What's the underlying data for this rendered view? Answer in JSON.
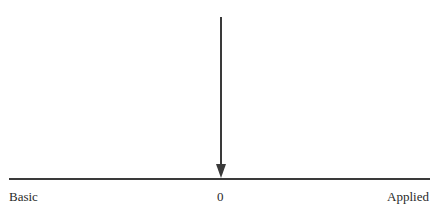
{
  "diagram": {
    "type": "continuum-axis",
    "axis": {
      "left_label": "Basic",
      "center_label": "0",
      "right_label": "Applied"
    },
    "marker": {
      "description": "downward arrow pointing at center (0)",
      "position": "0"
    },
    "colors": {
      "line": "#3a3a3a",
      "text": "#2a2a2a",
      "background": "#ffffff"
    }
  }
}
